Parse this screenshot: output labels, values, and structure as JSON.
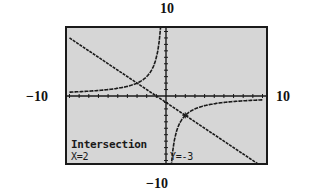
{
  "window_labels": {
    "ymax": "10",
    "ymin": "−10",
    "xmin": "−10",
    "xmax": "10"
  },
  "screen": {
    "title": "Intersection",
    "x_readout": "X=2",
    "y_readout": "Y=-3",
    "background_color": "#d6d6d6",
    "ink_color": "#1a1a1a"
  },
  "chart_data": {
    "type": "line",
    "title": "",
    "xlabel": "",
    "ylabel": "",
    "xlim": [
      -10,
      10
    ],
    "ylim": [
      -10,
      10
    ],
    "grid": false,
    "tick_spacing": 1,
    "series": [
      {
        "name": "y = -x - 1",
        "kind": "line",
        "x": [
          -10,
          10
        ],
        "y": [
          9,
          -11
        ]
      },
      {
        "name": "y = -6/x",
        "kind": "hyperbola",
        "k": -6
      }
    ],
    "intersections": [
      {
        "x": 2,
        "y": -3,
        "highlighted": true
      },
      {
        "x": -3,
        "y": 2,
        "highlighted": false
      }
    ],
    "annotations": [
      "Intersection",
      "X=2",
      "Y=-3"
    ]
  }
}
